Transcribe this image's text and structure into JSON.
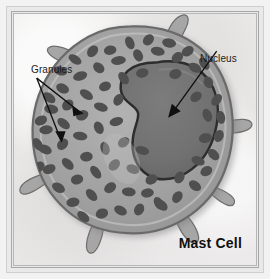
{
  "figure": {
    "title": "Mast Cell",
    "background_color": "#eceaea",
    "frame_color": "#a8a8a8"
  },
  "labels": {
    "granules": "Granules",
    "nucleus": "Nucleus"
  },
  "colors": {
    "background": "#eceaea",
    "cytoplasm": "#9d9d9d",
    "cytoplasm_light": "#b4b4b4",
    "granule": "#4f4f4f",
    "nucleus_fill": "#6f6f6f",
    "nucleus_outline": "#2d2d2d",
    "membrane": "#6a6a6a",
    "leader_line": "#111111",
    "text": "#1b1b1b"
  },
  "structures": [
    {
      "name": "cell-membrane",
      "label": "Cell membrane with finger-like projections"
    },
    {
      "name": "cytoplasm",
      "label": "Cytoplasm"
    },
    {
      "name": "granules",
      "label": "Granules"
    },
    {
      "name": "nucleus",
      "label": "Nucleus",
      "shape": "bilobed"
    }
  ]
}
